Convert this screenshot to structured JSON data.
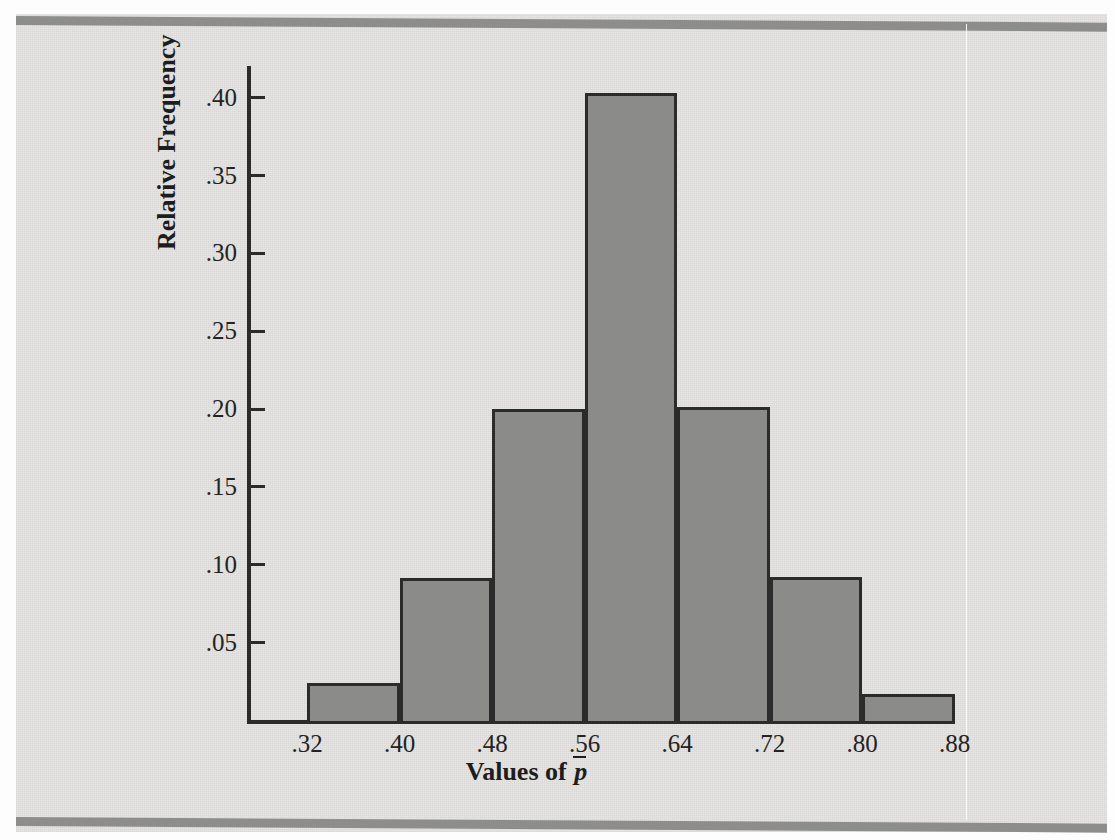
{
  "figure": {
    "x_axis_title_prefix": "Values of ",
    "x_axis_title_symbol": "p",
    "y_axis_title": "Relative Frequency"
  },
  "chart_data": {
    "type": "bar",
    "title": "",
    "subtitle": "",
    "xlabel": "Values of p̄",
    "ylabel": "Relative Frequency",
    "categories": [
      ".32-.40",
      ".40-.48",
      ".48-.56",
      ".56-.64",
      ".64-.72",
      ".72-.80",
      ".80-.88"
    ],
    "bin_edges": [
      0.32,
      0.4,
      0.48,
      0.56,
      0.64,
      0.72,
      0.8,
      0.88
    ],
    "values": [
      0.024,
      0.091,
      0.2,
      0.403,
      0.201,
      0.092,
      0.017
    ],
    "x_tick_labels": [
      ".32",
      ".40",
      ".48",
      ".56",
      ".64",
      ".72",
      ".80",
      ".88"
    ],
    "x_tick_values": [
      0.32,
      0.4,
      0.48,
      0.56,
      0.64,
      0.72,
      0.8,
      0.88
    ],
    "y_tick_labels": [
      ".05",
      ".10",
      ".15",
      ".20",
      ".25",
      ".30",
      ".35",
      ".40"
    ],
    "y_tick_values": [
      0.05,
      0.1,
      0.15,
      0.2,
      0.25,
      0.3,
      0.35,
      0.4
    ],
    "xlim": [
      0.275,
      0.955
    ],
    "ylim": [
      0.0,
      0.422
    ],
    "grid": false,
    "legend": null,
    "bar_fill_color": "#8b8b89",
    "bar_edge_color": "#2b2b2b",
    "background_color": "#e6e5e3"
  }
}
